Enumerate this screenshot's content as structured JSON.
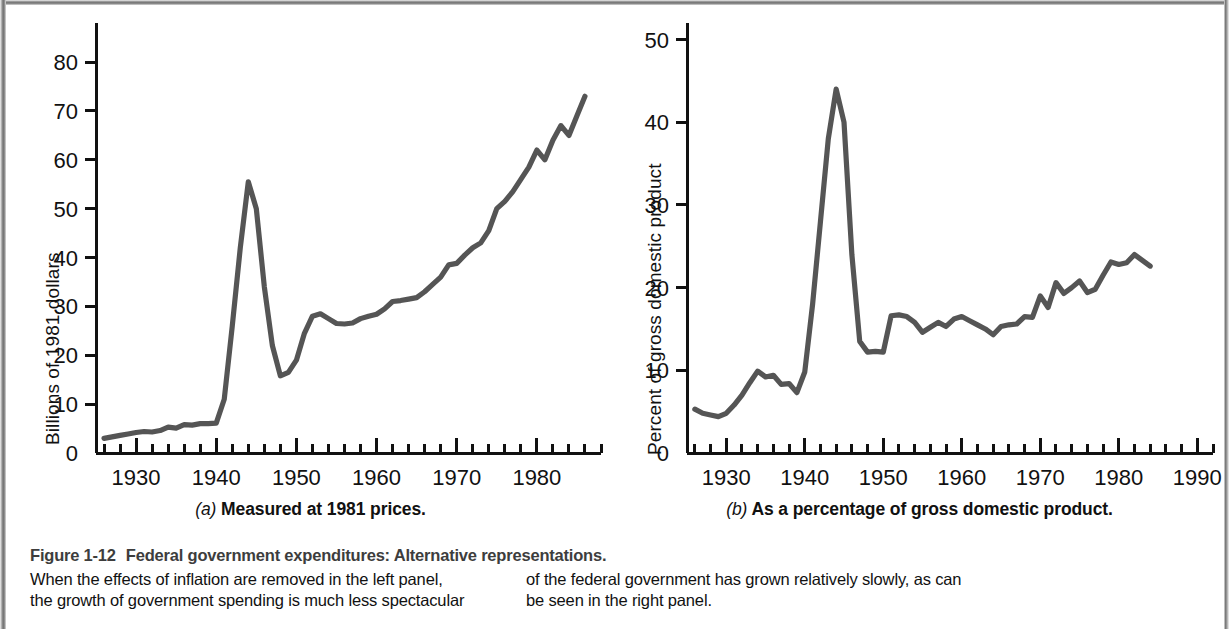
{
  "figure": {
    "number": "Figure 1-12",
    "title": "Federal government expenditures: Alternative representations.",
    "caption_left": [
      "When the effects of inflation are removed in the left panel,",
      "the growth of government spending is much less spectacular"
    ],
    "caption_right": [
      "of the federal government has grown relatively slowly, as can",
      "be seen in the right panel."
    ],
    "border_color": "#7d7d7d",
    "line_color": "#555555",
    "axis_color": "#111111"
  },
  "panel_a": {
    "letter": "(a)",
    "subcaption": "Measured at 1981 prices."
  },
  "panel_b": {
    "letter": "(b)",
    "subcaption": "As a percentage of gross domestic product."
  },
  "chart_data": [
    {
      "type": "line",
      "panel": "a",
      "title": "Measured at 1981 prices.",
      "xlabel": "",
      "ylabel": "Billions of 1981 dollars",
      "xlim": [
        1925,
        1988
      ],
      "ylim": [
        0,
        88
      ],
      "yticks": [
        0,
        10,
        20,
        30,
        40,
        50,
        60,
        70,
        80
      ],
      "ytick_labels": [
        "0",
        "10",
        "20",
        "30",
        "40",
        "50",
        "60",
        "70",
        "80"
      ],
      "xticks": [
        1930,
        1940,
        1950,
        1960,
        1970,
        1980
      ],
      "xtick_labels": [
        "1930",
        "1940",
        "1950",
        "1960",
        "1970",
        "1980"
      ],
      "minor_xtick_step": 2,
      "grid": false,
      "legend": "none",
      "x": [
        1926,
        1927,
        1928,
        1929,
        1930,
        1931,
        1932,
        1933,
        1934,
        1935,
        1936,
        1937,
        1938,
        1939,
        1940,
        1941,
        1942,
        1943,
        1944,
        1945,
        1946,
        1947,
        1948,
        1949,
        1950,
        1951,
        1952,
        1953,
        1954,
        1955,
        1956,
        1957,
        1958,
        1959,
        1960,
        1961,
        1962,
        1963,
        1964,
        1965,
        1966,
        1967,
        1968,
        1969,
        1970,
        1971,
        1972,
        1973,
        1974,
        1975,
        1976,
        1977,
        1978,
        1979,
        1980,
        1981,
        1982,
        1983,
        1984,
        1985,
        1986
      ],
      "y": [
        3.0,
        3.3,
        3.6,
        3.9,
        4.2,
        4.4,
        4.3,
        4.6,
        5.3,
        5.1,
        5.8,
        5.7,
        6.0,
        6.0,
        6.1,
        11.0,
        26.0,
        42.0,
        55.5,
        50.0,
        34.0,
        22.0,
        15.8,
        16.5,
        19.0,
        24.5,
        28.0,
        28.5,
        27.5,
        26.5,
        26.4,
        26.6,
        27.5,
        28.0,
        28.4,
        29.5,
        31.0,
        31.2,
        31.5,
        31.8,
        33.0,
        34.5,
        36.0,
        38.5,
        38.8,
        40.5,
        42.0,
        43.0,
        45.5,
        50.0,
        51.5,
        53.5,
        56.0,
        58.5,
        62.0,
        60.0,
        64.0,
        67.0,
        65.0,
        69.0,
        73.0
      ],
      "y_extra_note": "values read from curve; 1985 peak ~87, final 1986 ~84"
    },
    {
      "type": "line",
      "panel": "b",
      "title": "As a percentage of gross domestic product.",
      "xlabel": "",
      "ylabel": "Percent of gross domestic product",
      "xlim": [
        1925,
        1992
      ],
      "ylim": [
        0,
        52
      ],
      "yticks": [
        0,
        10,
        20,
        30,
        40,
        50
      ],
      "ytick_labels": [
        "0",
        "10",
        "20",
        "30",
        "40",
        "50"
      ],
      "xticks": [
        1930,
        1940,
        1950,
        1960,
        1970,
        1980,
        1990
      ],
      "xtick_labels": [
        "1930",
        "1940",
        "1950",
        "1960",
        "1970",
        "1980",
        "1990"
      ],
      "minor_xtick_step": 2,
      "grid": false,
      "legend": "none",
      "x": [
        1926,
        1927,
        1928,
        1929,
        1930,
        1931,
        1932,
        1933,
        1934,
        1935,
        1936,
        1937,
        1938,
        1939,
        1940,
        1941,
        1942,
        1943,
        1944,
        1945,
        1946,
        1947,
        1948,
        1949,
        1950,
        1951,
        1952,
        1953,
        1954,
        1955,
        1956,
        1957,
        1958,
        1959,
        1960,
        1961,
        1962,
        1963,
        1964,
        1965,
        1966,
        1967,
        1968,
        1969,
        1970,
        1971,
        1972,
        1973,
        1974,
        1975,
        1976,
        1977,
        1978,
        1979,
        1980,
        1981,
        1982,
        1983,
        1984,
        1985,
        1986
      ],
      "y": [
        5.3,
        4.8,
        4.6,
        4.4,
        4.8,
        5.8,
        7.0,
        8.5,
        9.9,
        9.2,
        9.4,
        8.3,
        8.4,
        7.3,
        9.8,
        18.0,
        28.0,
        38.0,
        44.0,
        40.0,
        24.0,
        13.5,
        12.2,
        12.3,
        12.2,
        16.6,
        16.7,
        16.5,
        15.8,
        14.6,
        15.2,
        15.8,
        15.3,
        16.2,
        16.5,
        16.0,
        15.5,
        15.0,
        14.3,
        15.3,
        15.5,
        15.6,
        16.5,
        16.4,
        19.0,
        17.6,
        20.6,
        19.3,
        20.0,
        20.8,
        19.4,
        19.8,
        21.5,
        23.1,
        22.8,
        23.0,
        24.0,
        23.3,
        22.6
      ]
    }
  ]
}
